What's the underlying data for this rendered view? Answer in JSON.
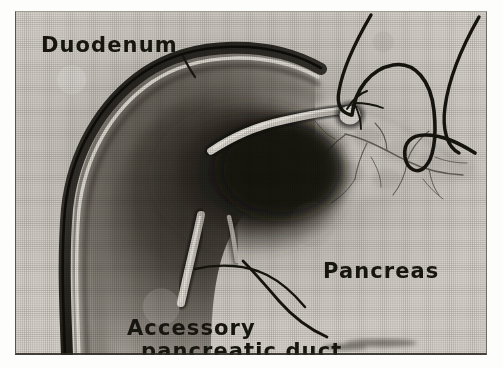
{
  "figure": {
    "kind": "anatomical-halftone-plate",
    "medium": "black-and-white halftone photograph",
    "plate_border_color": "#2e2b26",
    "ink_color": "#17150f",
    "paper_color": "#d8d4cd"
  },
  "labels": {
    "duodenum": {
      "text": "Duodenum",
      "x": 26,
      "y": 41,
      "font_size": 21
    },
    "pancreas": {
      "text": "Pancreas",
      "x": 308,
      "y": 267,
      "font_size": 21
    },
    "accessory_duct_line1": {
      "text": "Accessory",
      "x": 112,
      "y": 324,
      "font_size": 21
    },
    "accessory_duct_line2": {
      "text": "pancreatic duct",
      "x": 126,
      "y": 347,
      "font_size": 21
    }
  },
  "structures": [
    {
      "name": "duodenum-loop",
      "description": "C-shaped duodenal loop, dark outlined wall, shaded lumen"
    },
    {
      "name": "duodenal-wall-highlight",
      "description": "pale highlight stripe along inner curvature"
    },
    {
      "name": "pancreas-head",
      "description": "lobulated pale glandular tissue at right of duodenum"
    },
    {
      "name": "major-duodenal-papilla",
      "description": "small pale nodule where ducts enter the duodenum"
    },
    {
      "name": "main-pancreatic-duct",
      "description": "pale tubular duct running toward the papilla"
    },
    {
      "name": "accessory-pancreatic-duct",
      "description": "pale duct descending below the duodenum"
    },
    {
      "name": "probe-bristle-1",
      "description": "dark thread probe entering from top"
    },
    {
      "name": "probe-bristle-2",
      "description": "dark hairpin probe looping over the pancreas"
    },
    {
      "name": "probe-bristle-3",
      "description": "dark hairpin probe at upper right"
    },
    {
      "name": "duct-branches",
      "description": "fine branching intralobular ducts in pancreatic tail"
    }
  ],
  "leader_lines": [
    {
      "name": "duodenum-leader",
      "from_label": "Duodenum",
      "to_structure": "duodenum-loop"
    },
    {
      "name": "accessory-duct-leader",
      "from_label": "pancreatic duct",
      "to_structure": "accessory-pancreatic-duct"
    }
  ]
}
